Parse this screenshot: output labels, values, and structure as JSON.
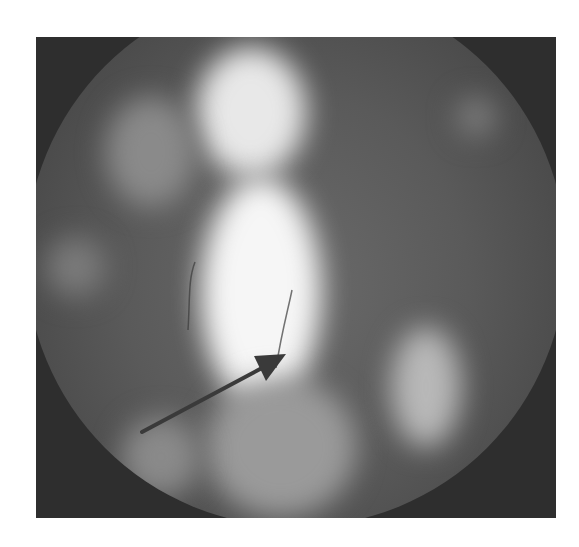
{
  "image": {
    "description": "Grayscale endoscopic image with circular field of view showing bright central tissue column and an overlaid dark arrow annotation",
    "frame": {
      "x": 36,
      "y": 37,
      "width": 520,
      "height": 481
    },
    "colors": {
      "background": "#ffffff",
      "corner_dark": "#2e2e2e",
      "field": "#5a5a5a",
      "highlight": "#f4f4f4",
      "arrow": "#3a3a3a"
    },
    "annotations": [
      {
        "type": "arrow",
        "from": [
          142,
          432
        ],
        "to": [
          286,
          355
        ],
        "color": "#3a3a3a"
      }
    ]
  }
}
